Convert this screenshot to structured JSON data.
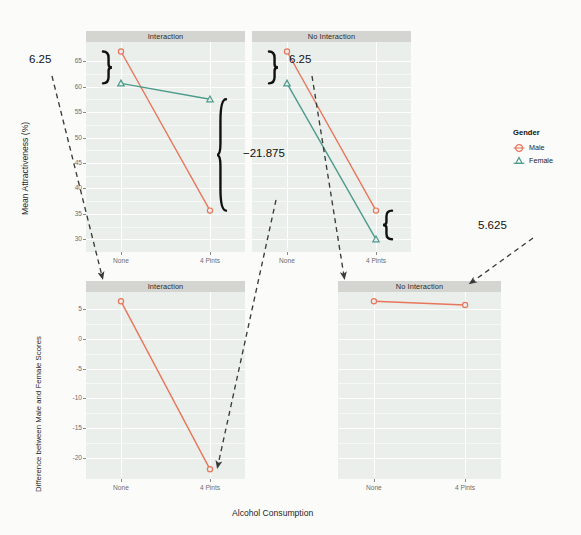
{
  "figure": {
    "x_axis_title": "Alcohol Consumption",
    "background_color": "#ffffff",
    "panel_color": "#ebefec",
    "strip_color": "#d4d4d1",
    "grid_color": "#ffffff"
  },
  "legend": {
    "title": "Gender",
    "entries": [
      {
        "label": "Male",
        "color": "#e8765a",
        "shape": "circle-open"
      },
      {
        "label": "Female",
        "color": "#4d9b8b",
        "shape": "triangle-open"
      }
    ]
  },
  "chart_data": [
    {
      "id": "top-left",
      "type": "line",
      "title": "Interaction",
      "panel_row": 0,
      "panel_col": 0,
      "xlabel": "Alcohol Consumption",
      "ylabel": "Mean Attractiveness (%)",
      "categories": [
        "None",
        "4 Pints"
      ],
      "xticks": [
        "None",
        "4 Pints"
      ],
      "yticks": [
        30,
        35,
        40,
        45,
        50,
        55,
        60,
        65
      ],
      "ylim": [
        27.5,
        68.75
      ],
      "grid": true,
      "legend_position": "right",
      "series": [
        {
          "name": "Male",
          "color": "#e8765a",
          "shape": "circle-open",
          "values": [
            66.875,
            35.625
          ]
        },
        {
          "name": "Female",
          "color": "#4d9b8b",
          "shape": "triangle-open",
          "values": [
            60.625,
            57.5
          ]
        }
      ],
      "annotations": [
        {
          "text": "6.25",
          "kind": "brace-left",
          "from": 66.875,
          "to": 60.625
        },
        {
          "text": "−21.875",
          "kind": "brace-right",
          "from": 57.5,
          "to": 35.625
        }
      ]
    },
    {
      "id": "top-right",
      "type": "line",
      "title": "No Interaction",
      "panel_row": 0,
      "panel_col": 1,
      "xlabel": "Alcohol Consumption",
      "ylabel": "Mean Attractiveness (%)",
      "categories": [
        "None",
        "4 Pints"
      ],
      "xticks": [
        "None",
        "4 Pints"
      ],
      "yticks": [
        30,
        35,
        40,
        45,
        50,
        55,
        60,
        65
      ],
      "ylim": [
        27.5,
        68.75
      ],
      "grid": true,
      "series": [
        {
          "name": "Male",
          "color": "#e8765a",
          "shape": "circle-open",
          "values": [
            66.875,
            35.625
          ]
        },
        {
          "name": "Female",
          "color": "#4d9b8b",
          "shape": "triangle-open",
          "values": [
            60.625,
            30.0
          ]
        }
      ],
      "annotations": [
        {
          "text": "6.25",
          "kind": "brace-left",
          "from": 66.875,
          "to": 60.625
        },
        {
          "text": "5.625",
          "kind": "brace-right",
          "from": 35.625,
          "to": 30.0
        }
      ]
    },
    {
      "id": "bottom-left",
      "type": "line",
      "title": "Interaction",
      "panel_row": 1,
      "panel_col": 0,
      "xlabel": "Alcohol Consumption",
      "ylabel": "Difference between Male and Female Scores",
      "categories": [
        "None",
        "4 Pints"
      ],
      "xticks": [
        "None",
        "4 Pints"
      ],
      "yticks": [
        5,
        0,
        -5,
        -10,
        -15,
        -20
      ],
      "ylim": [
        -23.5,
        7.8
      ],
      "grid": true,
      "series": [
        {
          "name": "Difference",
          "color": "#e8765a",
          "shape": "circle-open",
          "values": [
            6.25,
            -21.875
          ]
        }
      ]
    },
    {
      "id": "bottom-right",
      "type": "line",
      "title": "No Interaction",
      "panel_row": 1,
      "panel_col": 1,
      "xlabel": "Alcohol Consumption",
      "ylabel": "Difference between Male and Female Scores",
      "categories": [
        "None",
        "4 Pints"
      ],
      "xticks": [
        "None",
        "4 Pints"
      ],
      "yticks": [
        5,
        0,
        -5,
        -10,
        -15,
        -20
      ],
      "ylim": [
        -23.5,
        7.8
      ],
      "grid": true,
      "series": [
        {
          "name": "Difference",
          "color": "#e8765a",
          "shape": "circle-open",
          "values": [
            6.25,
            5.625
          ]
        }
      ]
    }
  ],
  "connector_arrows": [
    {
      "label": "6.25-left",
      "from_panel": "top-left",
      "to_panel": "bottom-left"
    },
    {
      "label": "-21.875",
      "from_panel": "top-left",
      "to_panel": "bottom-left"
    },
    {
      "label": "6.25-right",
      "from_panel": "top-right",
      "to_panel": "bottom-right"
    },
    {
      "label": "5.625",
      "from_panel": "top-right",
      "to_panel": "bottom-right"
    }
  ],
  "ylabels": {
    "top": "Mean Attractiveness (%)",
    "bottom": "Difference between Male and Female Scores"
  }
}
